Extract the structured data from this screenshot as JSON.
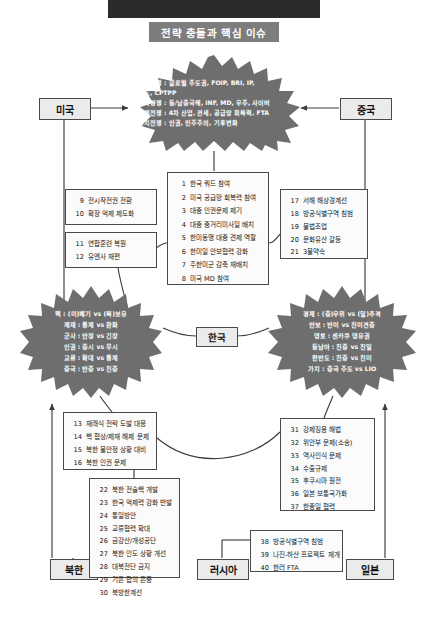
{
  "header": {
    "title": "전략 충돌과 핵심 이슈"
  },
  "actors": {
    "us": "미국",
    "china": "중국",
    "korea": "한국",
    "north_korea": "북한",
    "russia": "러시아",
    "japan": "일본"
  },
  "bursts": {
    "top": {
      "name": "us-china-strategic-competition",
      "lines": [
        "패권경쟁 : 글로벌 주도권, FOIP, BRI, IP,",
        "            쿼드, CPTPP",
        "군사경쟁 : 동/남중국해, INF, MD, 우주, 사이버",
        "경제전쟁 : 4차 산업, 관세, 공급망 회복력, FTA",
        "가치전쟁 : 인권, 민주주의, 기후변화"
      ]
    },
    "left": {
      "name": "us-nk-conflict",
      "lines": [
        "핵 : (미)폐기 vs (북)보유",
        "제재 : 통제 vs 완화",
        "군사 : 안정 vs 긴장",
        "인권 : 중시 vs 무시",
        "교류 : 확대 vs 통제",
        "중국 : 반중 vs 친중"
      ]
    },
    "right": {
      "name": "china-japan-conflict",
      "lines": [
        "경제 : (중)우위 vs (일)추격",
        "안보 : 반미 vs 친미견중",
        "영토 : 센카쿠 영유권",
        "동남아 : 친중 vs 친일",
        "한반도 : 친중 vs 친미",
        "가치 : 중국 주도 vs LIO"
      ]
    }
  },
  "boxes": {
    "center": {
      "name": "korea-us-china-issues",
      "items": [
        {
          "num": "1",
          "text": "한국 쿼드 참여"
        },
        {
          "num": "2",
          "text": "미국 공급망 회복력 참여"
        },
        {
          "num": "3",
          "text": "대중 인권문제 제기"
        },
        {
          "num": "4",
          "text": "대중 중거리미사일 배치"
        },
        {
          "num": "5",
          "text": "한미동맹 대중 견제 역할"
        },
        {
          "num": "6",
          "text": "한미일 안보협력 강화"
        },
        {
          "num": "7",
          "text": "주한미군 감축 재배치"
        },
        {
          "num": "8",
          "text": "미국 MD 참여"
        }
      ]
    },
    "upper_left_a": {
      "name": "korea-us-alliance-issues-a",
      "items": [
        {
          "num": "9",
          "text": "전시작전권 전환"
        },
        {
          "num": "10",
          "text": "확장 억제 제도화"
        }
      ]
    },
    "upper_left_b": {
      "name": "korea-us-alliance-issues-b",
      "items": [
        {
          "num": "11",
          "text": "연합훈련 복원"
        },
        {
          "num": "12",
          "text": "유엔사 재편"
        }
      ]
    },
    "upper_right": {
      "name": "korea-china-issues",
      "items": [
        {
          "num": "17",
          "text": "서해 해상경계선"
        },
        {
          "num": "18",
          "text": "방공식별구역 침범"
        },
        {
          "num": "19",
          "text": "불법조업"
        },
        {
          "num": "20",
          "text": "문화유산 갈등"
        },
        {
          "num": "21",
          "text": "3불약속"
        }
      ]
    },
    "lower_left": {
      "name": "korea-nk-security-issues",
      "items": [
        {
          "num": "13",
          "text": "재래식 전략 도발 대응"
        },
        {
          "num": "14",
          "text": "핵 협상/제재 해제 문제"
        },
        {
          "num": "15",
          "text": "북한 불안정 상황 대비"
        },
        {
          "num": "16",
          "text": "북한 인권 문제"
        }
      ]
    },
    "lower_right": {
      "name": "korea-japan-issues",
      "items": [
        {
          "num": "31",
          "text": "강제징용 해법"
        },
        {
          "num": "32",
          "text": "위안부 문제(소송)"
        },
        {
          "num": "33",
          "text": "역사인식 문제"
        },
        {
          "num": "34",
          "text": "수출규제"
        },
        {
          "num": "35",
          "text": "후쿠시마 원전"
        },
        {
          "num": "36",
          "text": "일본 보통국가화"
        },
        {
          "num": "37",
          "text": "한중일 협력"
        }
      ]
    },
    "bottom_left": {
      "name": "nk-inter-korean-issues",
      "items": [
        {
          "num": "22",
          "text": "북한 전술핵 개발"
        },
        {
          "num": "23",
          "text": "한국 억제력 강화 반발"
        },
        {
          "num": "24",
          "text": "통일방안"
        },
        {
          "num": "25",
          "text": "교류협력 확대"
        },
        {
          "num": "26",
          "text": "금강산/개성공단"
        },
        {
          "num": "27",
          "text": "북한 인도 상황 개선"
        },
        {
          "num": "28",
          "text": "대북전단 금지"
        },
        {
          "num": "29",
          "text": "기존 합의 존중"
        },
        {
          "num": "30",
          "text": "북방한계선"
        }
      ]
    },
    "bottom_right": {
      "name": "korea-russia-issues",
      "items": [
        {
          "num": "38",
          "text": "방공식별구역 침범"
        },
        {
          "num": "39",
          "text": "나진-하산 프로젝트 재개"
        },
        {
          "num": "40",
          "text": "한러 FTA"
        }
      ]
    }
  },
  "colors": {
    "topbar": "#2b2b2b",
    "title_chip": "#7d7d7d",
    "burst_fill": "#6e6e6e",
    "chip_fill": "#ebebeb",
    "line": "#3c3c3c"
  }
}
